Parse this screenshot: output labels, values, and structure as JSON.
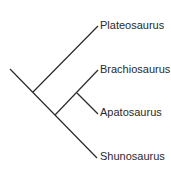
{
  "diagram": {
    "type": "cladogram",
    "taxa": [
      {
        "label": "Plateosaurus",
        "x": 100,
        "y": 20
      },
      {
        "label": "Brachiosaurus",
        "x": 100,
        "y": 64
      },
      {
        "label": "Apatosaurus",
        "x": 100,
        "y": 107
      },
      {
        "label": "Shunosaurus",
        "x": 100,
        "y": 151
      }
    ],
    "line_color": "#2a2a2a"
  }
}
